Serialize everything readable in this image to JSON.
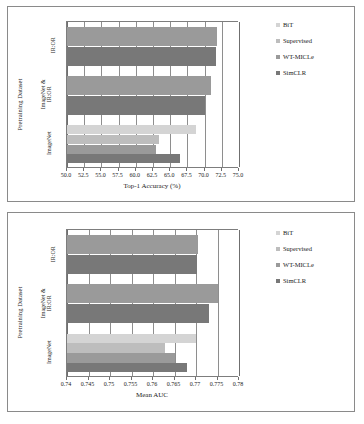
{
  "figure": {
    "series_names": [
      "BiT",
      "Supervised",
      "WT-MICLe",
      "SimCLR"
    ],
    "series_colors": [
      "#d4d4d4",
      "#bdbdbd",
      "#9a9a9a",
      "#787878"
    ],
    "categories": [
      "IR:OR",
      "ImageNet & IR:OR",
      "ImageNet"
    ],
    "y_axis_title": "Pretraining Dataset"
  },
  "charts": [
    {
      "id": "top-1-accuracy",
      "x_title": "Top-1 Accuracy (%)",
      "ticks": [
        "50.0",
        "52.5",
        "55.0",
        "57.5",
        "60.0",
        "62.5",
        "65.0",
        "67.5",
        "70.0",
        "72.5",
        "75.0"
      ]
    },
    {
      "id": "mean-auc",
      "x_title": "Mean AUC",
      "ticks": [
        "0.74",
        "0.745",
        "0.75",
        "0.755",
        "0.76",
        "0.765",
        "0.77",
        "0.775",
        "0.78"
      ]
    }
  ],
  "chart_data": [
    {
      "type": "bar",
      "orientation": "horizontal",
      "title": "",
      "xlabel": "Top-1 Accuracy (%)",
      "ylabel": "Pretraining Dataset",
      "xlim": [
        50.0,
        75.0
      ],
      "xticks": [
        50.0,
        52.5,
        55.0,
        57.5,
        60.0,
        62.5,
        65.0,
        67.5,
        70.0,
        72.5,
        75.0
      ],
      "grid": true,
      "legend_position": "right",
      "categories": [
        "IR:OR",
        "ImageNet & IR:OR",
        "ImageNet"
      ],
      "series": [
        {
          "name": "BiT",
          "color": "#d4d4d4",
          "values": [
            null,
            null,
            68.8
          ]
        },
        {
          "name": "Supervised",
          "color": "#bdbdbd",
          "values": [
            null,
            null,
            63.3
          ]
        },
        {
          "name": "WT-MICLe",
          "color": "#9a9a9a",
          "values": [
            71.8,
            71.0,
            62.9
          ]
        },
        {
          "name": "SimCLR",
          "color": "#787878",
          "values": [
            71.6,
            70.0,
            66.4
          ]
        }
      ]
    },
    {
      "type": "bar",
      "orientation": "horizontal",
      "title": "",
      "xlabel": "Mean AUC",
      "ylabel": "Pretraining Dataset",
      "xlim": [
        0.74,
        0.78
      ],
      "xticks": [
        0.74,
        0.745,
        0.75,
        0.755,
        0.76,
        0.765,
        0.77,
        0.775,
        0.78
      ],
      "grid": true,
      "legend_position": "right",
      "categories": [
        "IR:OR",
        "ImageNet & IR:OR",
        "ImageNet"
      ],
      "series": [
        {
          "name": "BiT",
          "color": "#d4d4d4",
          "values": [
            null,
            null,
            0.77
          ]
        },
        {
          "name": "Supervised",
          "color": "#bdbdbd",
          "values": [
            null,
            null,
            0.7628
          ]
        },
        {
          "name": "WT-MICLe",
          "color": "#9a9a9a",
          "values": [
            0.7705,
            0.775,
            0.765
          ]
        },
        {
          "name": "SimCLR",
          "color": "#787878",
          "values": [
            0.7702,
            0.773,
            0.7678
          ]
        }
      ]
    }
  ]
}
